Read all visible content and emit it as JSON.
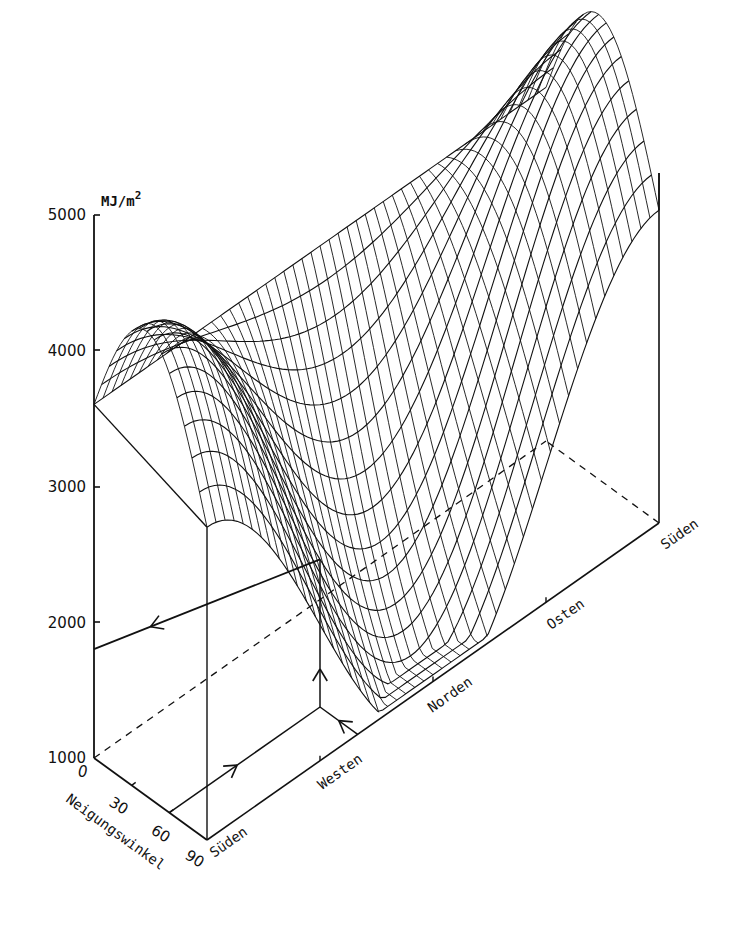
{
  "chart_data": {
    "type": "surface3d",
    "title": "",
    "zlabel": "MJ/m²",
    "zlabel_base": "MJ/m",
    "zlabel_exp": "2",
    "z_ticks": [
      1000,
      2000,
      3000,
      4000,
      5000
    ],
    "zlim": [
      1000,
      5000
    ],
    "x_axis": {
      "label": "Neigungswinkel",
      "ticks": [
        0,
        30,
        60,
        90
      ],
      "range": [
        0,
        90
      ]
    },
    "y_axis": {
      "label": "Azimut",
      "tick_labels": [
        "Süden",
        "Westen",
        "Norden",
        "Osten",
        "Süden"
      ],
      "tick_positions_deg": [
        0,
        90,
        180,
        270,
        360
      ]
    },
    "surface_samples": {
      "tilt": [
        0,
        30,
        60,
        90
      ],
      "azimuth": [
        0,
        90,
        180,
        270,
        360
      ],
      "values": [
        [
          3600,
          3600,
          3600,
          3600,
          3600
        ],
        [
          4050,
          3350,
          2700,
          3350,
          4050
        ],
        [
          4250,
          2850,
          1750,
          2850,
          4250
        ],
        [
          3500,
          2150,
          800,
          2150,
          3500
        ]
      ]
    },
    "reading_example": {
      "tilt": 60,
      "azimuth_deg": 120,
      "result": 1800
    },
    "grid": false,
    "legend": "none"
  },
  "colors": {
    "ink": "#111111",
    "background": "#ffffff"
  }
}
